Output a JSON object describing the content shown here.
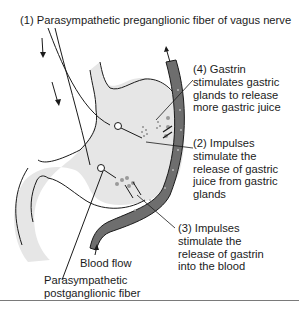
{
  "figure": {
    "colors": {
      "stomach_fill": "#e6e6e6",
      "vessel_fill": "#6e6e6e",
      "gland_dot": "#9a9a9a",
      "line": "#1a1a1a",
      "rule": "#7a7a7a"
    },
    "labels": {
      "preganglionic": "(1) Parasympathetic preganglionic fiber of vagus nerve",
      "gastrin": "(4) Gastrin\nstimulates gastric\nglands to release\nmore gastric juice",
      "impulses_juice": "(2) Impulses\nstimulate the\nrelease of gastric\njuice from gastric\nglands",
      "impulses_gastrin": "(3) Impulses\nstimulate the\nrelease of gastrin\ninto the blood",
      "blood_flow": "Blood flow",
      "postganglionic": "Parasympathetic\npostganglionic fiber"
    }
  }
}
